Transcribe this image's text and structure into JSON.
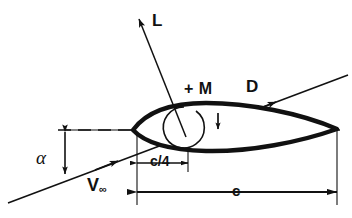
{
  "figure": {
    "stroke_color": "#111111",
    "background_color": "#ffffff"
  },
  "labels": {
    "lift": "L",
    "moment": "+ M",
    "drag": "D",
    "angle_of_attack": "α",
    "freestream_velocity": "V",
    "freestream_velocity_subscript": "∞",
    "quarter_chord": "c/4",
    "chord": "c"
  },
  "elements": {
    "airfoil_name": "airfoil-section",
    "chord_line_name": "chord-centerline-dashed",
    "freestream_line_name": "freestream-velocity-line",
    "lift_vector_name": "lift-force-arrow",
    "drag_vector_name": "drag-force-arrow",
    "moment_arc_name": "pitching-moment-arc",
    "alpha_arrow_name": "angle-of-attack-double-arrow",
    "quarter_chord_dimension_name": "quarter-chord-dimension",
    "chord_dimension_name": "chord-dimension"
  },
  "geometry": {
    "leading_edge": [
      133,
      130
    ],
    "trailing_edge": [
      337,
      130
    ],
    "quarter_chord_point": [
      184,
      130
    ],
    "chord_length_px": 204,
    "angle_of_attack_deg": 17,
    "chord_dimension_y": 192,
    "quarter_chord_dimension_y": 163
  }
}
